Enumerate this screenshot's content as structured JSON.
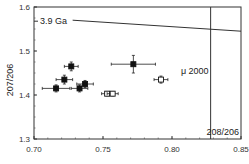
{
  "chart_data": {
    "type": "scatter",
    "title": "",
    "xlabel": "208/206",
    "ylabel": "207/206",
    "xlim": [
      0.7,
      0.85
    ],
    "ylim": [
      1.3,
      1.6
    ],
    "x_ticks": [
      "0.70",
      "0.75",
      "0.80",
      "0.85"
    ],
    "y_ticks": [
      "1.3",
      "1.4",
      "1.5",
      "1.6"
    ],
    "grid": false,
    "series": [
      {
        "name": "filled squares",
        "marker": "filled-square",
        "points": [
          {
            "x": 0.727,
            "y": 1.465,
            "xerr": 0.005,
            "yerr": 0.01
          },
          {
            "x": 0.722,
            "y": 1.435,
            "xerr": 0.006,
            "yerr": 0.01
          },
          {
            "x": 0.716,
            "y": 1.415,
            "xerr": 0.01,
            "yerr": 0.008
          },
          {
            "x": 0.733,
            "y": 1.415,
            "xerr": 0.006,
            "yerr": 0.008
          },
          {
            "x": 0.737,
            "y": 1.425,
            "xerr": 0.006,
            "yerr": 0.008
          },
          {
            "x": 0.772,
            "y": 1.47,
            "xerr": 0.016,
            "yerr": 0.02
          }
        ]
      },
      {
        "name": "open squares",
        "marker": "open-square",
        "points": [
          {
            "x": 0.753,
            "y": 1.403,
            "xerr": 0.004,
            "yerr": 0.005
          },
          {
            "x": 0.757,
            "y": 1.403,
            "xerr": 0.004,
            "yerr": 0.005
          },
          {
            "x": 0.792,
            "y": 1.435,
            "xerr": 0.005,
            "yerr": 0.008
          }
        ]
      }
    ],
    "annotations": [
      {
        "text": "3.9 Ga",
        "type": "line",
        "from": [
          0.728,
          1.57
        ],
        "to": [
          0.85,
          1.545
        ]
      },
      {
        "text": "μ 2000",
        "type": "vertical-line",
        "x": 0.828
      },
      {
        "text": "208/206",
        "type": "axis-label"
      }
    ]
  }
}
